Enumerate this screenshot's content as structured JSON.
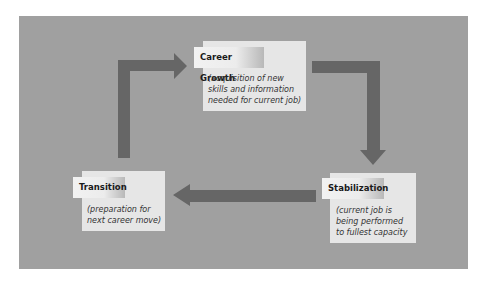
{
  "diagram": {
    "background_color": "#a0a0a0",
    "arrow_color": "#666666",
    "stages": [
      {
        "id": "career-growth",
        "title": "Career Growth",
        "description": "(acquisition of new\nskills and information\nneeded for current job)"
      },
      {
        "id": "stabilization",
        "title": "Stabilization",
        "description": "(current job is\nbeing performed\nto fullest capacity"
      },
      {
        "id": "transition",
        "title": "Transition",
        "description": "(preparation for\nnext career move)"
      }
    ],
    "flow": [
      "Career Growth",
      "Stabilization",
      "Transition",
      "Career Growth"
    ]
  }
}
